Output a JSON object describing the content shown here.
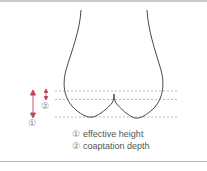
{
  "diagram": {
    "labels": {
      "marker_1": "①",
      "marker_2": "②"
    },
    "legend": [
      {
        "marker": "①",
        "text": "effective height"
      },
      {
        "marker": "②",
        "text": "coaptation depth"
      }
    ],
    "colors": {
      "arrow": "#c0485a",
      "outline": "#333333",
      "dashed_line": "#aaaaaa",
      "border": "#c9c9c9"
    }
  }
}
